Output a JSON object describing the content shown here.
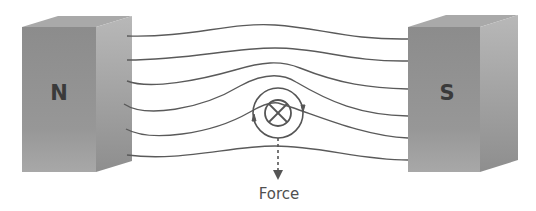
{
  "diagram": {
    "north_magnet": {
      "label": "N",
      "color": "#8f8f8f"
    },
    "south_magnet": {
      "label": "S",
      "color": "#8f8f8f"
    },
    "field_lines": {
      "count": 6,
      "color": "#5a5a5a"
    },
    "wire": {
      "current_direction": "into page",
      "symbol": "⊗",
      "field_circulation": "clockwise"
    },
    "force_label": "Force",
    "force_direction": "down"
  }
}
